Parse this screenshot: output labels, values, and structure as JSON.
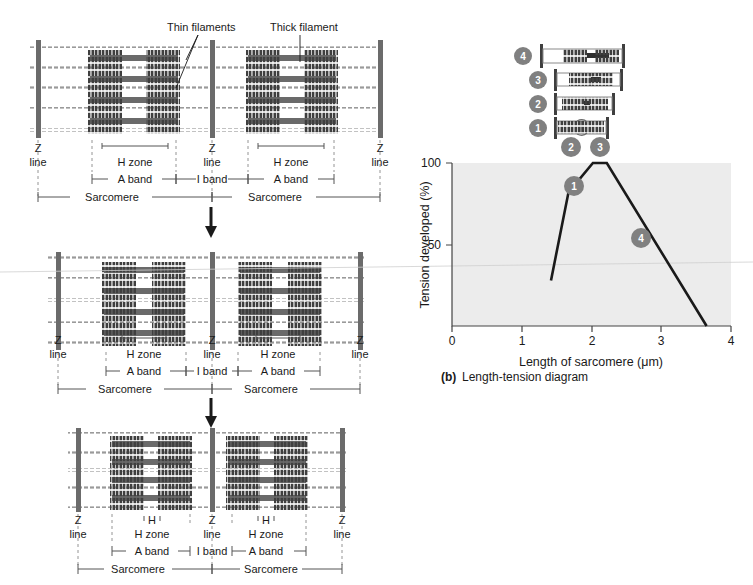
{
  "figure": {
    "panel_b_caption_prefix": "(b)",
    "panel_b_caption": "Length-tension diagram"
  },
  "callouts": {
    "thin_filaments": "Thin filaments",
    "thick_filament": "Thick filament"
  },
  "labels": {
    "z": "Z",
    "line": "line",
    "h": "H",
    "h_zone": "H zone",
    "a_band": "A band",
    "i_band": "I band",
    "sarcomere": "Sarcomere"
  },
  "sarcomere_panels": [
    {
      "name": "panel-stretched",
      "state": "stretched",
      "z_lines": [
        "Z",
        "Z",
        "Z"
      ],
      "h_zone_labels": [
        "H zone",
        "H zone"
      ],
      "band_labels": [
        "A band",
        "I band",
        "A band"
      ],
      "sarcomere_labels": [
        "Sarcomere",
        "Sarcomere"
      ],
      "h_over_label": false
    },
    {
      "name": "panel-optimal",
      "state": "optimal",
      "z_lines": [
        "Z",
        "Z",
        "Z"
      ],
      "h_zone_labels": [
        "H zone",
        "H zone"
      ],
      "band_labels": [
        "A band",
        "I band",
        "A band"
      ],
      "sarcomere_labels": [
        "Sarcomere",
        "Sarcomere"
      ],
      "h_over_label": false
    },
    {
      "name": "panel-contracted",
      "state": "contracted",
      "z_lines": [
        "Z",
        "Z",
        "Z"
      ],
      "h_zone_labels": [
        "H zone",
        "H zone"
      ],
      "h_marks": [
        "H",
        "H"
      ],
      "band_labels": [
        "A band",
        "I band",
        "A band"
      ],
      "sarcomere_labels": [
        "Sarcomere",
        "Sarcomere"
      ],
      "h_over_label": true
    }
  ],
  "sarcomere_icons": [
    {
      "id": "4",
      "label": "4",
      "relative_length": 1.0
    },
    {
      "id": "3",
      "label": "3",
      "relative_length": 0.82
    },
    {
      "id": "2",
      "label": "2",
      "relative_length": 0.72
    },
    {
      "id": "1",
      "label": "1",
      "relative_length": 0.62
    }
  ],
  "curve_markers": [
    {
      "id": "1",
      "label": "1"
    },
    {
      "id": "2",
      "label": "2"
    },
    {
      "id": "3",
      "label": "3"
    },
    {
      "id": "4",
      "label": "4"
    }
  ],
  "colors": {
    "plot_background": "#ececec",
    "curve": "#1a1a1a",
    "axis": "#444444",
    "marker_fill": "#808080",
    "thick_filament": "#4a4a4a",
    "thin_filament": "#9a9a9a",
    "z_line": "#6b6b6b"
  },
  "chart_data": {
    "type": "line",
    "title": "Length-tension diagram",
    "xlabel": "Length of sarcomere (μm)",
    "ylabel": "Tension developed (%)",
    "xlim": [
      0,
      4
    ],
    "ylim": [
      0,
      100
    ],
    "xticks": [
      0,
      1,
      2,
      3,
      4
    ],
    "xtick_labels": [
      "0",
      "1",
      "2",
      "3",
      "4"
    ],
    "yticks": [
      50,
      100
    ],
    "ytick_labels": [
      "50",
      "100"
    ],
    "grid": false,
    "legend": "none",
    "series": [
      {
        "name": "Tension developed",
        "x": [
          1.42,
          1.67,
          2.02,
          2.22,
          3.65
        ],
        "values": [
          28,
          82,
          100,
          100,
          0
        ]
      }
    ],
    "annotations": [
      {
        "label": "1",
        "x": 1.62,
        "y": 84,
        "placement": "left-of-curve"
      },
      {
        "label": "2",
        "x": 1.98,
        "y": 112,
        "placement": "above-plateau-left"
      },
      {
        "label": "3",
        "x": 2.26,
        "y": 112,
        "placement": "above-plateau-right"
      },
      {
        "label": "4",
        "x": 3.12,
        "y": 52,
        "placement": "right-of-curve"
      }
    ]
  }
}
